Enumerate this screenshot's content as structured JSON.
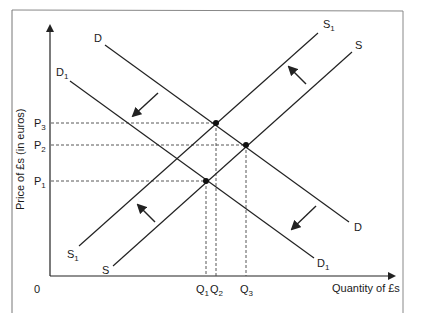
{
  "diagram": {
    "type": "supply-demand",
    "axes": {
      "y_label": "Price of £s (in euros)",
      "x_label": "Quantity of £s",
      "origin_label": "0"
    },
    "price_labels": [
      {
        "base": "P",
        "sub": "3"
      },
      {
        "base": "P",
        "sub": "2"
      },
      {
        "base": "P",
        "sub": "1"
      }
    ],
    "quantity_labels": [
      {
        "base": "Q",
        "sub": "1"
      },
      {
        "base": "Q",
        "sub": "2"
      },
      {
        "base": "Q",
        "sub": "3"
      }
    ],
    "curves": [
      {
        "id": "D",
        "label": "D",
        "kind": "demand"
      },
      {
        "id": "D1",
        "label": "D",
        "sub": "1",
        "kind": "demand-shifted-left"
      },
      {
        "id": "S",
        "label": "S",
        "kind": "supply"
      },
      {
        "id": "S1",
        "label": "S",
        "sub": "1",
        "kind": "supply-shifted-left"
      }
    ],
    "equilibria": [
      {
        "curves": "D & S1",
        "price": "P3",
        "quantity": "Q2"
      },
      {
        "curves": "D & S",
        "price": "P2",
        "quantity": "Q3"
      },
      {
        "curves": "D1 & S1",
        "price": "P1",
        "quantity": "Q1"
      }
    ],
    "shift_arrows": [
      {
        "curve": "D",
        "direction": "down-left"
      },
      {
        "curve": "S",
        "direction": "up-left"
      }
    ],
    "colors": {
      "line": "#222222",
      "frame": "#777777",
      "dashed": "#444444"
    }
  }
}
